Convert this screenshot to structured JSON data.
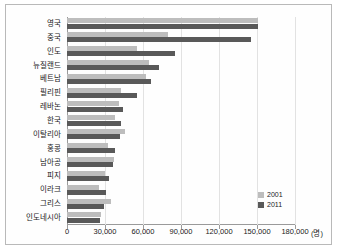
{
  "chart_data": {
    "type": "bar",
    "orientation": "horizontal",
    "title": "",
    "xlabel": "(명)",
    "ylabel": "",
    "xlim": [
      0,
      180000
    ],
    "xticks": [
      0,
      30000,
      60000,
      90000,
      120000,
      150000,
      180000
    ],
    "xtick_labels": [
      "0",
      "30,000",
      "60,000",
      "90,000",
      "120,000",
      "150,000",
      "180,000"
    ],
    "unit_label": "(명)",
    "grid": true,
    "legend_position": "bottom-right",
    "categories": [
      "영국",
      "중국",
      "인도",
      "뉴질랜드",
      "베트남",
      "필리핀",
      "레바논",
      "한국",
      "이탈리아",
      "홍콩",
      "남아공",
      "피지",
      "이라크",
      "그리스",
      "인도네시아"
    ],
    "series": [
      {
        "name": "2001",
        "color": "#bdbdbd",
        "values": [
          151000,
          80000,
          55000,
          65000,
          62000,
          43000,
          41000,
          38000,
          46000,
          32000,
          37000,
          30000,
          25000,
          35000,
          27000
        ]
      },
      {
        "name": "2011",
        "color": "#595959",
        "values": [
          151000,
          145000,
          85000,
          73000,
          66000,
          55000,
          44000,
          43000,
          42000,
          38000,
          36000,
          33000,
          31000,
          29000,
          26000
        ]
      }
    ]
  },
  "legend": {
    "items": [
      {
        "label": "2001",
        "color": "#bdbdbd"
      },
      {
        "label": "2011",
        "color": "#595959"
      }
    ]
  }
}
